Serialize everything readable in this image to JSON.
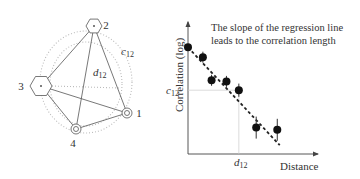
{
  "network": {
    "nodes": [
      {
        "id": "1",
        "label": "1",
        "shape": "circle",
        "x": 127,
        "y": 113,
        "r": 5,
        "label_x": 139,
        "label_y": 117
      },
      {
        "id": "2",
        "label": "2",
        "shape": "hexagon",
        "x": 94,
        "y": 26,
        "r": 8,
        "label_x": 106,
        "label_y": 29
      },
      {
        "id": "3",
        "label": "3",
        "shape": "hexagon",
        "x": 41,
        "y": 86,
        "r": 11,
        "label_x": 21,
        "label_y": 90
      },
      {
        "id": "4",
        "label": "4",
        "shape": "circle",
        "x": 76,
        "y": 129,
        "r": 5,
        "label_x": 73,
        "label_y": 147
      }
    ],
    "edges": [
      [
        "1",
        "2"
      ],
      [
        "2",
        "3"
      ],
      [
        "2",
        "4"
      ],
      [
        "3",
        "1"
      ],
      [
        "3",
        "4"
      ],
      [
        "4",
        "1"
      ]
    ],
    "distance_label": {
      "text": "d",
      "sub": "12"
    },
    "correlation_label": {
      "text": "c",
      "sub": "12"
    }
  },
  "chart_data": {
    "type": "scatter",
    "title": "",
    "annotation": [
      "The slope of the regression line",
      "leads to the correlation length"
    ],
    "xlabel": "Distance",
    "ylabel": "Correlation (log)",
    "x_tick_labels": [
      {
        "text": "d",
        "sub": "12"
      }
    ],
    "y_tick_labels": [
      {
        "text": "c",
        "sub": "12"
      }
    ],
    "grid": false,
    "legend": null,
    "points": [
      {
        "x": 0.0,
        "y": 0.97,
        "err": 0.0
      },
      {
        "x": 0.12,
        "y": 0.88,
        "err": 0.05
      },
      {
        "x": 0.19,
        "y": 0.67,
        "err": 0.05
      },
      {
        "x": 0.31,
        "y": 0.66,
        "err": 0.05
      },
      {
        "x": 0.41,
        "y": 0.58,
        "err": 0.06
      },
      {
        "x": 0.55,
        "y": 0.24,
        "err": 0.1
      },
      {
        "x": 0.72,
        "y": 0.22,
        "err": 0.1
      }
    ],
    "regression_line": {
      "style": "dashed",
      "x0": 0.0,
      "y0": 0.97,
      "x1": 0.74,
      "y1": 0.08
    },
    "reference": {
      "x_label": "d12",
      "y_label": "c12",
      "x": 0.41,
      "y": 0.58
    }
  }
}
